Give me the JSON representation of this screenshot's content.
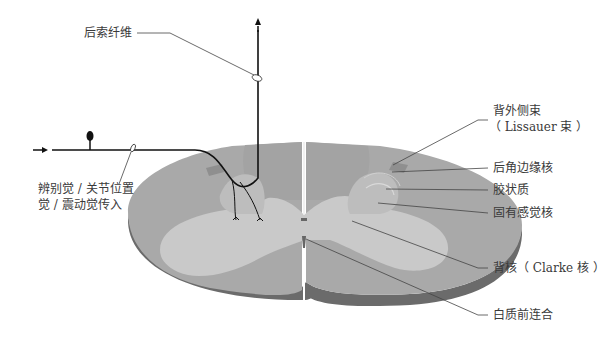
{
  "diagram": {
    "colors": {
      "white_matter": "#a9a9a9",
      "gray_matter": "#c9c9c9",
      "dorsal_horn": "#bdbdbd",
      "side_edge": "#6b6b6b",
      "fiber": "#111111",
      "leader": "#444444",
      "lissauer": "#8f8f8f"
    },
    "labels": {
      "posterior_column": "后索纤维",
      "input_line1": "辨别觉 / 关节位置",
      "input_line2": "觉 / 震动觉传入",
      "lissauer_line1": "背外侧束",
      "lissauer_line2": "（ Lissauer 束 ）",
      "marginal": "后角边缘核",
      "gelatinosa": "胶状质",
      "proprius": "固有感觉核",
      "clarke": "背核（ Clarke 核 ）",
      "commissure": "白质前连合"
    }
  }
}
